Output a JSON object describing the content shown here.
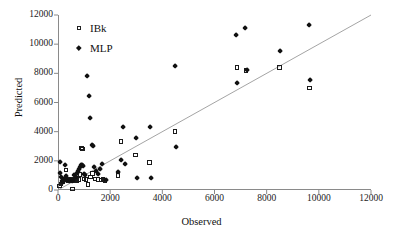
{
  "chart_data": {
    "type": "scatter",
    "title": "",
    "xlabel": "Observed",
    "ylabel": "Predicted",
    "xlim": [
      0,
      12000
    ],
    "ylim": [
      0,
      12000
    ],
    "xticks": [
      0,
      2000,
      4000,
      6000,
      8000,
      10000,
      12000
    ],
    "yticks": [
      0,
      2000,
      4000,
      6000,
      8000,
      10000,
      12000
    ],
    "xtick_labels": [
      "0",
      "2000",
      "4000",
      "6000",
      "8000",
      "10000",
      "12000"
    ],
    "ytick_labels": [
      "0",
      "2000",
      "4000",
      "6000",
      "8000",
      "10000",
      "12000"
    ],
    "grid": false,
    "legend_position": "top-left",
    "reference_line": {
      "name": "y = x identity line",
      "from": [
        0,
        0
      ],
      "to": [
        12000,
        12000
      ],
      "color": "#9a9a9a"
    },
    "series": [
      {
        "name": "IBk",
        "marker": "open-square",
        "color": "#1b1b1b",
        "points": [
          [
            60,
            280
          ],
          [
            110,
            420
          ],
          [
            170,
            560
          ],
          [
            230,
            700
          ],
          [
            300,
            1380
          ],
          [
            380,
            640
          ],
          [
            450,
            700
          ],
          [
            520,
            620
          ],
          [
            560,
            60
          ],
          [
            600,
            700
          ],
          [
            660,
            760
          ],
          [
            720,
            640
          ],
          [
            790,
            700
          ],
          [
            840,
            1060
          ],
          [
            900,
            2880
          ],
          [
            950,
            2800
          ],
          [
            1000,
            760
          ],
          [
            1080,
            700
          ],
          [
            1150,
            380
          ],
          [
            1250,
            900
          ],
          [
            1330,
            1120
          ],
          [
            1420,
            760
          ],
          [
            1530,
            700
          ],
          [
            1650,
            680
          ],
          [
            1720,
            700
          ],
          [
            1800,
            660
          ],
          [
            2300,
            980
          ],
          [
            2420,
            3320
          ],
          [
            2980,
            2400
          ],
          [
            3500,
            1880
          ],
          [
            4480,
            4000
          ],
          [
            6860,
            8400
          ],
          [
            7200,
            8180
          ],
          [
            8500,
            8400
          ],
          [
            9650,
            7000
          ]
        ]
      },
      {
        "name": "MLP",
        "marker": "filled-diamond",
        "color": "#111111",
        "points": [
          [
            70,
            1880
          ],
          [
            90,
            1160
          ],
          [
            120,
            900
          ],
          [
            150,
            640
          ],
          [
            180,
            760
          ],
          [
            210,
            520
          ],
          [
            260,
            1740
          ],
          [
            300,
            980
          ],
          [
            360,
            700
          ],
          [
            420,
            640
          ],
          [
            480,
            700
          ],
          [
            540,
            620
          ],
          [
            580,
            660
          ],
          [
            620,
            1000
          ],
          [
            680,
            900
          ],
          [
            720,
            1180
          ],
          [
            760,
            1300
          ],
          [
            800,
            1420
          ],
          [
            850,
            1560
          ],
          [
            880,
            1700
          ],
          [
            920,
            1720
          ],
          [
            960,
            1640
          ],
          [
            1000,
            1080
          ],
          [
            1050,
            1000
          ],
          [
            1100,
            7780
          ],
          [
            1180,
            6440
          ],
          [
            1230,
            4940
          ],
          [
            1300,
            3100
          ],
          [
            1330,
            3040
          ],
          [
            1380,
            1540
          ],
          [
            1450,
            1320
          ],
          [
            1520,
            1060
          ],
          [
            1600,
            1420
          ],
          [
            1700,
            1800
          ],
          [
            1850,
            700
          ],
          [
            2300,
            1240
          ],
          [
            2420,
            2060
          ],
          [
            2500,
            4340
          ],
          [
            2560,
            1780
          ],
          [
            3000,
            3560
          ],
          [
            3050,
            820
          ],
          [
            3520,
            4340
          ],
          [
            3560,
            820
          ],
          [
            4500,
            8520
          ],
          [
            4520,
            2960
          ],
          [
            6820,
            10600
          ],
          [
            6880,
            7300
          ],
          [
            7180,
            11120
          ],
          [
            7240,
            8220
          ],
          [
            8520,
            9500
          ],
          [
            9620,
            11320
          ],
          [
            9680,
            7540
          ]
        ]
      }
    ]
  },
  "legend": {
    "entries": [
      {
        "label": "IBk",
        "marker": "open-square-icon"
      },
      {
        "label": "MLP",
        "marker": "filled-diamond-icon"
      }
    ]
  },
  "axes": {
    "x_title": "Observed",
    "y_title": "Predicted"
  }
}
